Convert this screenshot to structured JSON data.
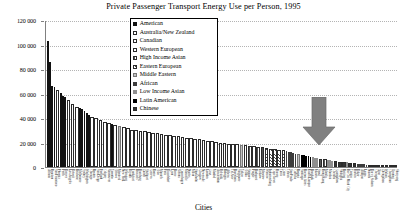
{
  "chart": {
    "title": "Private Passenger Transport Energy Use per Person, 1995",
    "xlabel": "Cities",
    "ylabel": ""
  },
  "legend": {
    "items": [
      {
        "label": "American",
        "pattern": "p-solid"
      },
      {
        "label": "Australia/New Zealand",
        "pattern": "p-open"
      },
      {
        "label": "Canadian",
        "pattern": "p-dot"
      },
      {
        "label": "Western European",
        "pattern": "p-vert"
      },
      {
        "label": "High Income Asian",
        "pattern": "p-grid"
      },
      {
        "label": "Eastern European",
        "pattern": "p-hatch"
      },
      {
        "label": "Middle Eastern",
        "pattern": "p-lgray"
      },
      {
        "label": "African",
        "pattern": "p-dark"
      },
      {
        "label": "Low Income Asian",
        "pattern": "p-gray"
      },
      {
        "label": "Latin American",
        "pattern": "p-black2"
      },
      {
        "label": "Chinese",
        "pattern": "p-dense"
      }
    ]
  },
  "annotation": {
    "arrow_name": "down-arrow-annotation",
    "color": "#808080"
  },
  "chart_data": {
    "type": "bar",
    "title": "Private Passenger Transport Energy Use per Person, 1995",
    "xlabel": "Cities",
    "ylabel": "",
    "ylim": [
      0,
      120000
    ],
    "yticks": [
      0,
      20000,
      40000,
      60000,
      80000,
      100000,
      120000
    ],
    "ytick_labels": [
      "0",
      "20 000",
      "40 000",
      "60 000",
      "80 000",
      "100 000",
      "120 000"
    ],
    "grid": true,
    "legend_position": "top-center",
    "series_groups": [
      "American",
      "Australia/New Zealand",
      "Canadian",
      "Western European",
      "High Income Asian",
      "Eastern European",
      "Middle Eastern",
      "African",
      "Low Income Asian",
      "Latin American",
      "Chinese"
    ],
    "categories": [
      "Atlanta",
      "Houston",
      "San Francisco",
      "Phoenix",
      "Perth",
      "Denver",
      "Los Angeles",
      "Detroit",
      "Brisbane",
      "Melbourne",
      "Sydney",
      "Washington",
      "Chicago",
      "Boston",
      "San Diego",
      "Portland",
      "Calgary",
      "Vancouver",
      "Toronto",
      "Ottawa",
      "Montreal",
      "New York",
      "Winnipeg",
      "Riyadh",
      "Frankfurt",
      "Brussels",
      "Hamburg",
      "Zurich",
      "Stuttgart",
      "Geneva",
      "Rome",
      "Oslo",
      "Munich",
      "Paris",
      "Dusseldorf",
      "Lyon",
      "Berne",
      "Vienna",
      "Copenhagen",
      "Marseille",
      "Nantes",
      "Milan",
      "Stockholm",
      "Glasgow",
      "Newcastle",
      "London",
      "Graz",
      "Madrid",
      "Amsterdam",
      "Helsinki",
      "Bologna",
      "Athens",
      "Tel Aviv",
      "Barcelona",
      "Singapore",
      "Tokyo",
      "Osaka",
      "Sapporo",
      "Prague",
      "Budapest",
      "Krakow",
      "Moscow",
      "Warsaw",
      "Johannesburg",
      "Cape Town",
      "Harare",
      "Tunis",
      "Cairo",
      "Tehran",
      "Sao Paulo",
      "Curitiba",
      "Bogota",
      "Santiago",
      "Buenos Aires",
      "Kuala Lumpur",
      "Bangkok",
      "Jakarta",
      "Seoul",
      "Hong Kong",
      "Manila",
      "Mumbai",
      "Chennai",
      "Guangzhou",
      "Shanghai",
      "Beijing",
      "Ho Chi Minh City",
      "Tianjin",
      "Harbin",
      "Dakar",
      "Abidjan",
      "Lagos",
      "Nairobi",
      "Dar es Salaam",
      "Chengdu",
      "Xian",
      "Zhengzhou",
      "Wuhan",
      "Changchun",
      "Urumqi",
      "Shenyang"
    ],
    "values": [
      103000,
      86000,
      66000,
      65000,
      63000,
      60500,
      58000,
      57000,
      54500,
      51500,
      49000,
      48500,
      47000,
      45500,
      44000,
      42500,
      41000,
      40000,
      38500,
      37000,
      36000,
      35000,
      34500,
      33500,
      32500,
      31500,
      30500,
      30000,
      29500,
      29000,
      28500,
      28000,
      27500,
      27000,
      26500,
      26000,
      25500,
      25000,
      24500,
      24000,
      23500,
      23000,
      22500,
      22000,
      21500,
      21000,
      20500,
      20000,
      19500,
      19000,
      18800,
      18500,
      18200,
      18000,
      17500,
      17000,
      16500,
      16000,
      15500,
      15000,
      14500,
      14000,
      13500,
      13000,
      12500,
      12000,
      11500,
      11000,
      10500,
      10000,
      9600,
      9200,
      8800,
      8400,
      8000,
      7600,
      7200,
      6800,
      6400,
      6000,
      5600,
      5200,
      4800,
      4400,
      4000,
      3700,
      3400,
      3100,
      2800,
      2500,
      2300,
      2100,
      1900,
      1700,
      1500,
      1300,
      1100,
      900,
      700,
      500
    ],
    "group_of_bar": [
      "American",
      "American",
      "American",
      "American",
      "Australia/New Zealand",
      "American",
      "American",
      "American",
      "Australia/New Zealand",
      "Australia/New Zealand",
      "Australia/New Zealand",
      "American",
      "American",
      "American",
      "American",
      "American",
      "Canadian",
      "Canadian",
      "Canadian",
      "Canadian",
      "Canadian",
      "American",
      "Canadian",
      "Middle Eastern",
      "Western European",
      "Western European",
      "Western European",
      "Western European",
      "Western European",
      "Western European",
      "Western European",
      "Western European",
      "Western European",
      "Western European",
      "Western European",
      "Western European",
      "Western European",
      "Western European",
      "Western European",
      "Western European",
      "Western European",
      "Western European",
      "Western European",
      "Western European",
      "Western European",
      "Western European",
      "Western European",
      "Western European",
      "Western European",
      "Western European",
      "Western European",
      "Western European",
      "Middle Eastern",
      "Western European",
      "High Income Asian",
      "High Income Asian",
      "High Income Asian",
      "High Income Asian",
      "Eastern European",
      "Eastern European",
      "Eastern European",
      "Eastern European",
      "Eastern European",
      "African",
      "African",
      "African",
      "African",
      "African",
      "Middle Eastern",
      "Latin American",
      "Latin American",
      "Latin American",
      "Latin American",
      "Latin American",
      "Low Income Asian",
      "Low Income Asian",
      "Low Income Asian",
      "High Income Asian",
      "High Income Asian",
      "Low Income Asian",
      "Low Income Asian",
      "Low Income Asian",
      "Chinese",
      "Chinese",
      "Chinese",
      "Low Income Asian",
      "Chinese",
      "Chinese",
      "African",
      "African",
      "African",
      "African",
      "African",
      "Chinese",
      "Chinese",
      "Chinese",
      "Chinese",
      "Chinese",
      "Chinese",
      "Chinese"
    ]
  }
}
